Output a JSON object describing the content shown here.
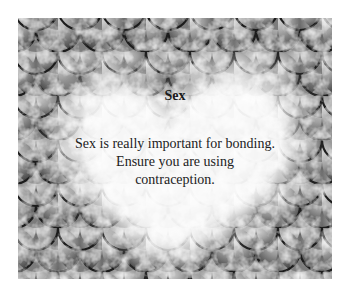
{
  "card": {
    "title": "Sex",
    "body": "Sex is really important for bonding. Ensure you are using contraception.",
    "background": "fish-scale-pattern",
    "overlay": "heart-glow",
    "colors": {
      "scale_dark": "#2a2a2a",
      "scale_mid": "#8a8a8a",
      "scale_light": "#d8d8d8",
      "glow": "#ffffff",
      "text": "#222222"
    }
  }
}
